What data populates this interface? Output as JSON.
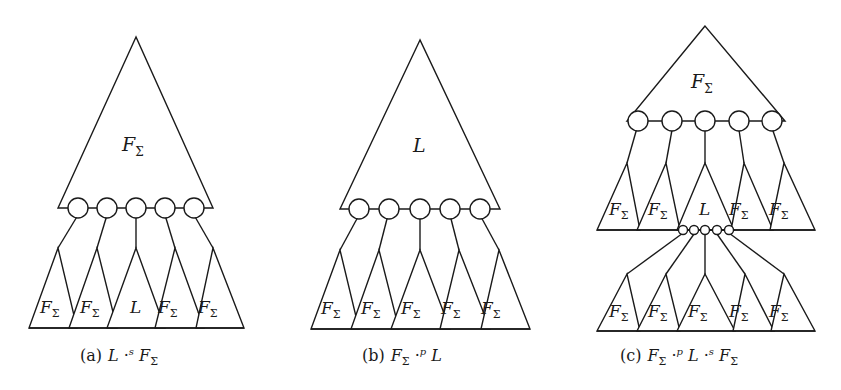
{
  "figure": {
    "panels": [
      {
        "id": "a",
        "caption_prefix": "(a)",
        "caption_parts": [
          "L",
          " ·",
          "s",
          " F",
          "Σ"
        ],
        "top_triangle": {
          "label": "F",
          "label_sub": "Σ"
        },
        "junction_nodes": 5,
        "bottom_triangles": [
          {
            "label": "F",
            "sub": "Σ"
          },
          {
            "label": "F",
            "sub": "Σ"
          },
          {
            "label": "L",
            "sub": ""
          },
          {
            "label": "F",
            "sub": "Σ"
          },
          {
            "label": "F",
            "sub": "Σ"
          }
        ]
      },
      {
        "id": "b",
        "caption_prefix": "(b)",
        "caption_parts": [
          "F",
          "Σ",
          " ·",
          "p",
          " L"
        ],
        "top_triangle": {
          "label": "L",
          "label_sub": ""
        },
        "junction_nodes": 5,
        "bottom_triangles": [
          {
            "label": "F",
            "sub": "Σ"
          },
          {
            "label": "F",
            "sub": "Σ"
          },
          {
            "label": "F",
            "sub": "Σ"
          },
          {
            "label": "F",
            "sub": "Σ"
          },
          {
            "label": "F",
            "sub": "Σ"
          }
        ]
      },
      {
        "id": "c",
        "caption_prefix": "(c)",
        "caption_parts": [
          "F",
          "Σ",
          " ·",
          "p",
          " L",
          " ·",
          "s",
          " F",
          "Σ"
        ],
        "top_triangle": {
          "label": "F",
          "label_sub": "Σ"
        },
        "junction_nodes": 5,
        "middle_triangles": [
          {
            "label": "F",
            "sub": "Σ"
          },
          {
            "label": "F",
            "sub": "Σ"
          },
          {
            "label": "L",
            "sub": ""
          },
          {
            "label": "F",
            "sub": "Σ"
          },
          {
            "label": "F",
            "sub": "Σ"
          }
        ],
        "small_junction_nodes": 5,
        "bottom_triangles": [
          {
            "label": "F",
            "sub": "Σ"
          },
          {
            "label": "F",
            "sub": "Σ"
          },
          {
            "label": "F",
            "sub": "Σ"
          },
          {
            "label": "F",
            "sub": "Σ"
          },
          {
            "label": "F",
            "sub": "Σ"
          }
        ]
      }
    ]
  }
}
